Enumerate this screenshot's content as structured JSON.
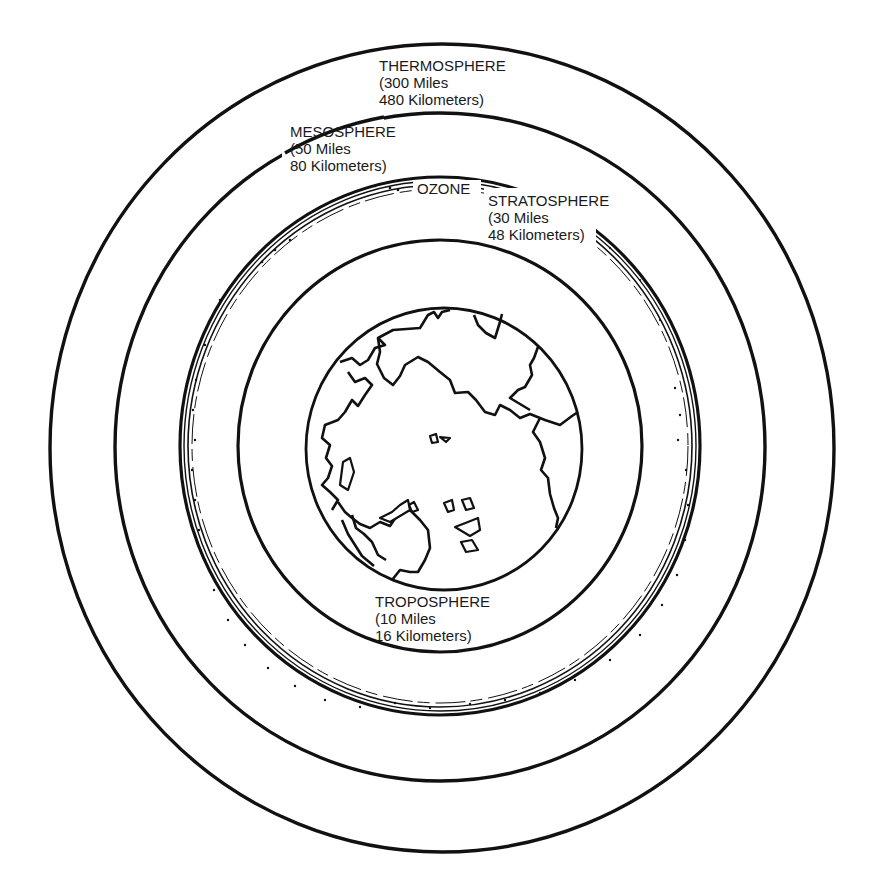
{
  "diagram": {
    "colors": {
      "line": "#111111",
      "background": "#ffffff"
    },
    "layers": [
      {
        "name": "THERMOSPHERE",
        "miles": "(300 Miles",
        "kilometers": "480 Kilometers)"
      },
      {
        "name": "MESOSPHERE",
        "miles": "(50 Miles",
        "kilometers": "80 Kilometers)"
      },
      {
        "name": "STRATOSPHERE",
        "miles": "(30 Miles",
        "kilometers": "48 Kilometers)"
      },
      {
        "name": "TROPOSPHERE",
        "miles": "(10 Miles",
        "kilometers": "16 Kilometers)"
      }
    ],
    "ozone_label": "OZONE",
    "center_object": "earth"
  }
}
